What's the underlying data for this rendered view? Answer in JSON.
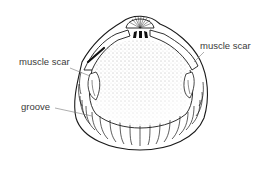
{
  "figure": {
    "labels": [
      {
        "id": "left-muscle-scar",
        "text": "muscle scar"
      },
      {
        "id": "right-muscle-scar",
        "text": "muscle scar"
      },
      {
        "id": "groove",
        "text": "groove"
      }
    ],
    "colors": {
      "line": "#1a1a1a",
      "label": "#3a3a3a",
      "leader": "#777777",
      "background": "#ffffff"
    }
  }
}
